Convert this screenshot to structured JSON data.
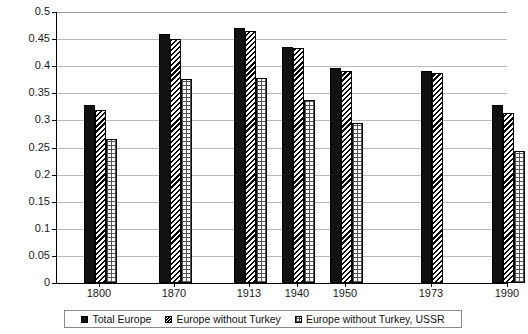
{
  "chart_data": {
    "type": "bar",
    "title": "",
    "xlabel": "",
    "ylabel": "",
    "ylim": [
      0,
      0.5
    ],
    "ytick_labels": [
      "0.5",
      "0.45",
      "0.4",
      "0.35",
      "0.3",
      "0.25",
      "0.2",
      "0.15",
      "0.1",
      "0.05",
      "0"
    ],
    "ytick_values": [
      0.5,
      0.45,
      0.4,
      0.35,
      0.3,
      0.25,
      0.2,
      0.15,
      0.1,
      0.05,
      0
    ],
    "grid": true,
    "categories": [
      "1800",
      "1870",
      "1913",
      "1940",
      "1950",
      "1973",
      "1990",
      "2003"
    ],
    "legend_position": "bottom",
    "series": [
      {
        "name": "Total Europe",
        "pattern": "solid-black",
        "values": [
          0.329,
          0.459,
          0.471,
          0.436,
          0.396,
          0.392,
          0.329,
          0.258
        ]
      },
      {
        "name": "Europe without Turkey",
        "pattern": "diagonal-hatch",
        "values": [
          0.32,
          0.45,
          0.465,
          0.434,
          0.391,
          0.387,
          0.314,
          0.25
        ]
      },
      {
        "name": "Europe without Turkey, USSR",
        "pattern": "grid-hatch",
        "values": [
          0.265,
          0.376,
          0.378,
          0.337,
          0.295,
          null,
          0.243,
          0.211
        ]
      }
    ]
  }
}
